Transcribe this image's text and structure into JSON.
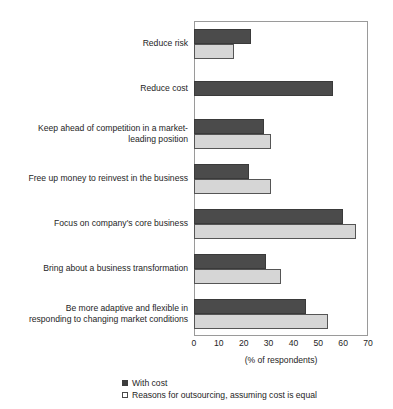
{
  "chart_data": {
    "type": "bar",
    "orientation": "horizontal",
    "title": "",
    "xlabel": "(% of respondents)",
    "ylabel": "",
    "xlim": [
      0,
      70
    ],
    "xticks": [
      0,
      10,
      20,
      30,
      40,
      50,
      60,
      70
    ],
    "grid": false,
    "legend_position": "bottom-left",
    "categories": [
      "Reduce risk",
      "Reduce cost",
      "Keep ahead of competition in a market-leading position",
      "Free up money to reinvest in the business",
      "Focus on company's core business",
      "Bring about a business transformation",
      "Be more adaptive and flexible in responding to changing market conditions"
    ],
    "category_lines": [
      [
        "Reduce risk"
      ],
      [
        "Reduce cost"
      ],
      [
        "Keep ahead of competition in a market-",
        "leading position"
      ],
      [
        "Free up money to reinvest in the business"
      ],
      [
        "Focus on company's core business"
      ],
      [
        "Bring about a business transformation"
      ],
      [
        "Be more adaptive and flexible in",
        "responding to changing market conditions"
      ]
    ],
    "series": [
      {
        "name": "With cost",
        "color": "#4b4b4b",
        "values": [
          23,
          56,
          28,
          22,
          60,
          29,
          45
        ]
      },
      {
        "name": "Reasons for outsourcing, assuming cost is equal",
        "color": "#d6d6d6",
        "values": [
          16,
          null,
          31,
          31,
          65,
          35,
          54
        ]
      }
    ]
  },
  "legend": {
    "items": [
      {
        "label": "With cost",
        "swatch": "dark"
      },
      {
        "label": "Reasons for outsourcing, assuming cost is equal",
        "swatch": "light"
      }
    ]
  },
  "axis": {
    "title": "(% of respondents)",
    "ticks": [
      "0",
      "10",
      "20",
      "30",
      "40",
      "50",
      "60",
      "70"
    ]
  }
}
